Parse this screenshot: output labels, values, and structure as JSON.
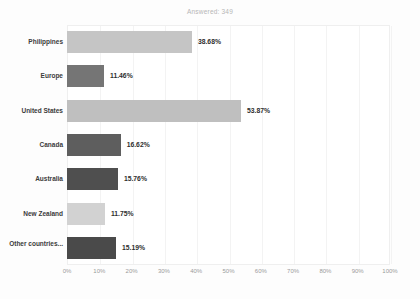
{
  "chart_data": {
    "type": "bar",
    "orientation": "horizontal",
    "title": "Answered: 349",
    "xlabel": "",
    "ylabel": "",
    "xlim": [
      0,
      100
    ],
    "grid": true,
    "legend": false,
    "categories": [
      "Philippines",
      "Europe",
      "United States",
      "Canada",
      "Australia",
      "New Zealand",
      "Other countries..."
    ],
    "values": [
      38.68,
      11.46,
      53.87,
      16.62,
      15.76,
      11.75,
      15.19
    ],
    "value_labels": [
      "38.68%",
      "11.46%",
      "53.87%",
      "16.62%",
      "15.76%",
      "11.75%",
      "15.19%"
    ],
    "bar_colors": [
      "#c5c5c5",
      "#757575",
      "#bfbfbf",
      "#5e5e5e",
      "#4f4f4f",
      "#d2d2d2",
      "#4a4a4a"
    ],
    "xticks": [
      0,
      10,
      20,
      30,
      40,
      50,
      60,
      70,
      80,
      90,
      100
    ],
    "xtick_labels": [
      "0%",
      "10%",
      "20%",
      "30%",
      "40%",
      "50%",
      "60%",
      "70%",
      "80%",
      "90%",
      "100%"
    ]
  },
  "colors": {
    "plot_background": "#ffffff",
    "page_background": "#fdfdfd",
    "gridline": "#f3f3f3",
    "title_text": "#b6b6b6",
    "category_text": "#3b3b3b",
    "value_text": "#2e2e2e",
    "tick_text": "#9b9b9b"
  }
}
